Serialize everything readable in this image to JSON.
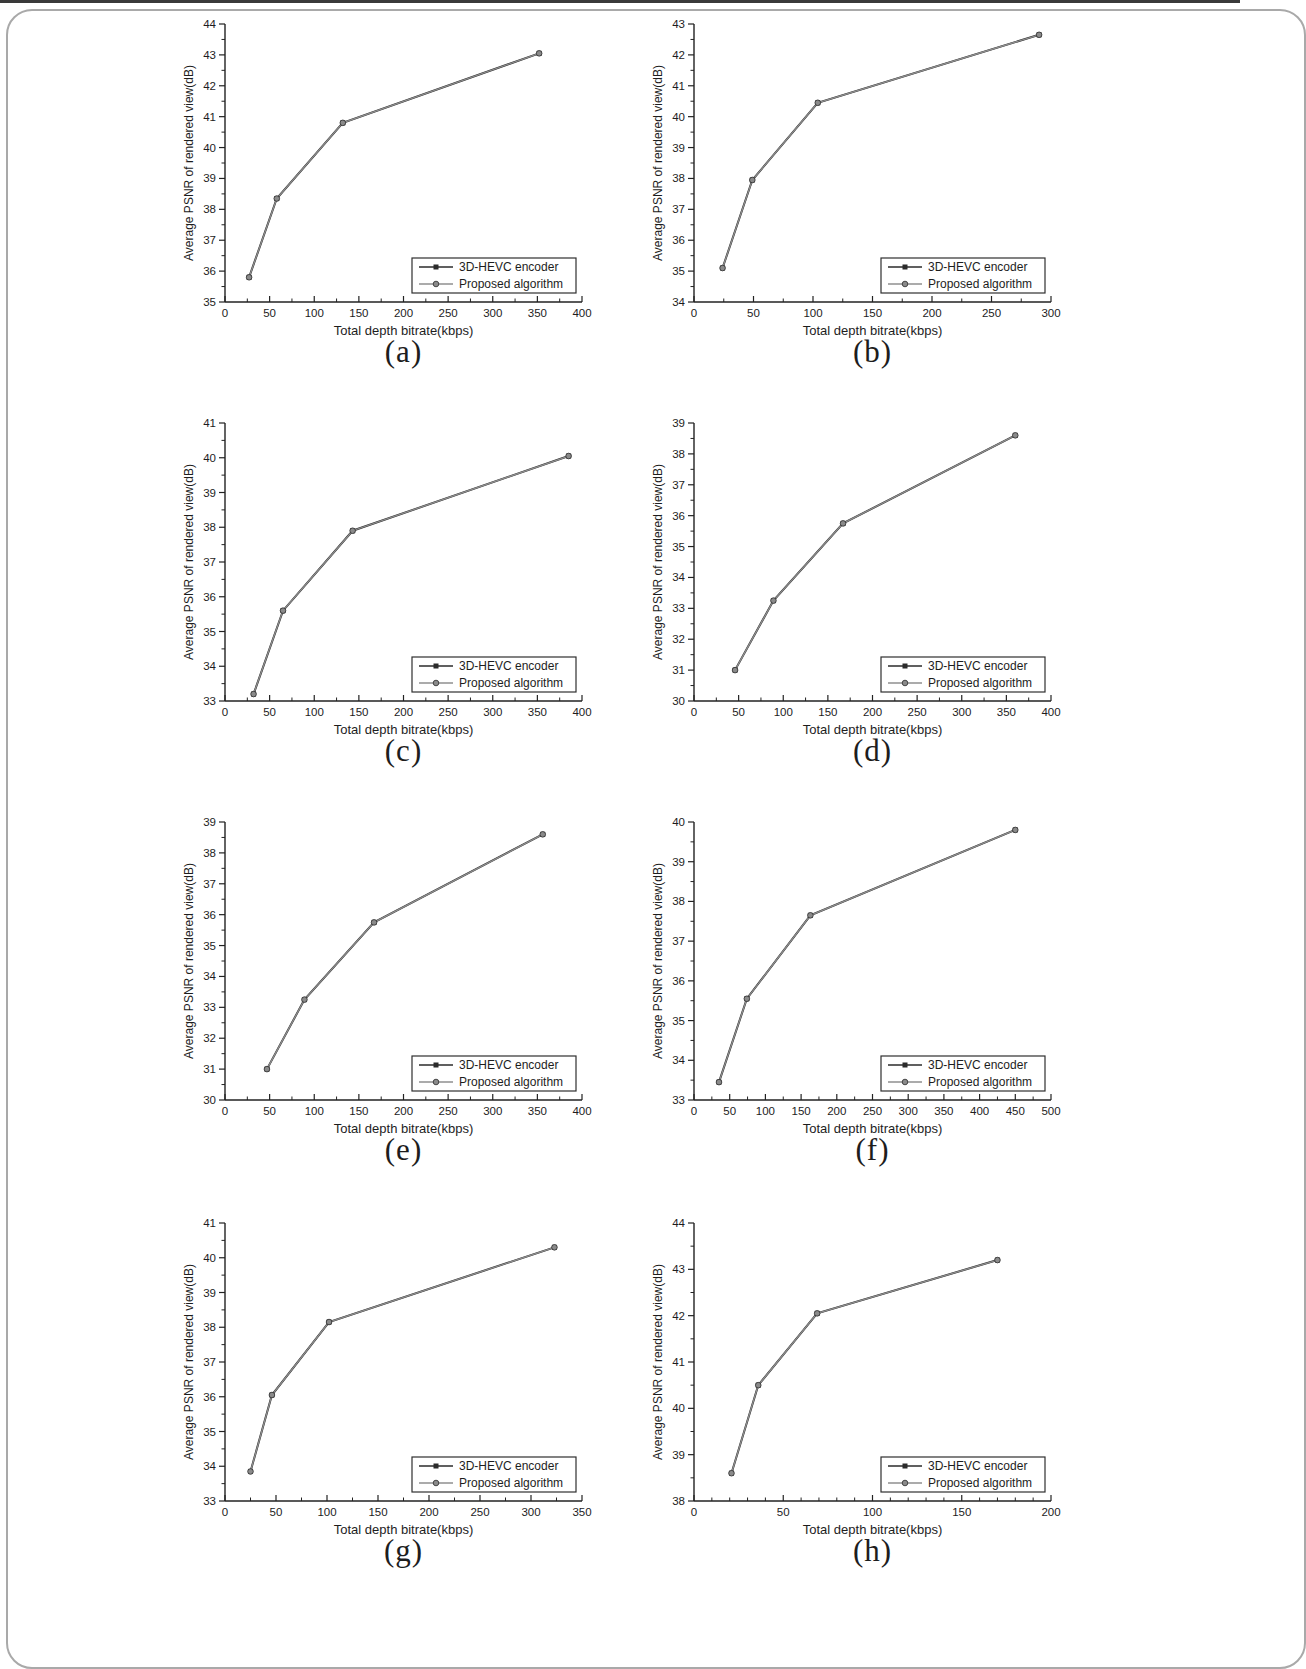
{
  "figure": {
    "xlabel": "Total depth bitrate(kbps)",
    "ylabel": "Average PSNR of rendered view(dB)",
    "series_labels": [
      "3D-HEVC encoder",
      "Proposed algorithm"
    ],
    "legend_position": "bottom-right",
    "grid": "off",
    "colors": {
      "encoder_line": "#2b2b2b",
      "proposed_line": "#8f8f8f",
      "marker_fill": "#8a8a8a",
      "marker_edge": "#3a3a3a",
      "axis": "#222222",
      "text": "#1d1d1d"
    }
  },
  "chart_data": [
    {
      "type": "line",
      "label": "(a)",
      "xlabel": "Total depth bitrate(kbps)",
      "ylabel": "Average PSNR of rendered view(dB)",
      "xlim": [
        0,
        400
      ],
      "xticks": [
        0,
        50,
        100,
        150,
        200,
        250,
        300,
        350,
        400
      ],
      "x_minor_per_major": 1,
      "ylim": [
        35,
        44
      ],
      "yticks": [
        35,
        36,
        37,
        38,
        39,
        40,
        41,
        42,
        43,
        44
      ],
      "y_minor_per_major": 1,
      "series": [
        {
          "name": "3D-HEVC encoder",
          "x": [
            27,
            58,
            132,
            352
          ],
          "y": [
            35.8,
            38.35,
            40.8,
            43.05
          ]
        },
        {
          "name": "Proposed algorithm",
          "x": [
            27,
            58,
            132,
            352
          ],
          "y": [
            35.8,
            38.35,
            40.8,
            43.05
          ]
        }
      ]
    },
    {
      "type": "line",
      "label": "(b)",
      "xlabel": "Total depth bitrate(kbps)",
      "ylabel": "Average PSNR of rendered view(dB)",
      "xlim": [
        0,
        300
      ],
      "xticks": [
        0,
        50,
        100,
        150,
        200,
        250,
        300
      ],
      "x_minor_per_major": 1,
      "ylim": [
        34,
        43
      ],
      "yticks": [
        34,
        35,
        36,
        37,
        38,
        39,
        40,
        41,
        42,
        43
      ],
      "y_minor_per_major": 1,
      "series": [
        {
          "name": "3D-HEVC encoder",
          "x": [
            24,
            49,
            104,
            290
          ],
          "y": [
            35.1,
            37.95,
            40.45,
            42.65
          ]
        },
        {
          "name": "Proposed algorithm",
          "x": [
            24,
            49,
            104,
            290
          ],
          "y": [
            35.1,
            37.95,
            40.45,
            42.65
          ]
        }
      ]
    },
    {
      "type": "line",
      "label": "(c)",
      "xlabel": "Total depth bitrate(kbps)",
      "ylabel": "Average PSNR of rendered view(dB)",
      "xlim": [
        0,
        400
      ],
      "xticks": [
        0,
        50,
        100,
        150,
        200,
        250,
        300,
        350,
        400
      ],
      "x_minor_per_major": 1,
      "ylim": [
        33,
        41
      ],
      "yticks": [
        33,
        34,
        35,
        36,
        37,
        38,
        39,
        40,
        41
      ],
      "y_minor_per_major": 1,
      "series": [
        {
          "name": "3D-HEVC encoder",
          "x": [
            32,
            65,
            143,
            385
          ],
          "y": [
            33.2,
            35.6,
            37.9,
            40.05
          ]
        },
        {
          "name": "Proposed algorithm",
          "x": [
            32,
            65,
            143,
            385
          ],
          "y": [
            33.2,
            35.6,
            37.9,
            40.05
          ]
        }
      ]
    },
    {
      "type": "line",
      "label": "(d)",
      "xlabel": "Total depth bitrate(kbps)",
      "ylabel": "Average PSNR of rendered view(dB)",
      "xlim": [
        0,
        400
      ],
      "xticks": [
        0,
        50,
        100,
        150,
        200,
        250,
        300,
        350,
        400
      ],
      "x_minor_per_major": 1,
      "ylim": [
        30,
        39
      ],
      "yticks": [
        30,
        31,
        32,
        33,
        34,
        35,
        36,
        37,
        38,
        39
      ],
      "y_minor_per_major": 1,
      "series": [
        {
          "name": "3D-HEVC encoder",
          "x": [
            46,
            89,
            167,
            360
          ],
          "y": [
            31.0,
            33.25,
            35.75,
            38.6
          ]
        },
        {
          "name": "Proposed algorithm",
          "x": [
            46,
            89,
            167,
            360
          ],
          "y": [
            31.0,
            33.25,
            35.75,
            38.6
          ]
        }
      ]
    },
    {
      "type": "line",
      "label": "(e)",
      "xlabel": "Total depth bitrate(kbps)",
      "ylabel": "Average PSNR of rendered view(dB)",
      "xlim": [
        0,
        400
      ],
      "xticks": [
        0,
        50,
        100,
        150,
        200,
        250,
        300,
        350,
        400
      ],
      "x_minor_per_major": 1,
      "ylim": [
        30,
        39
      ],
      "yticks": [
        30,
        31,
        32,
        33,
        34,
        35,
        36,
        37,
        38,
        39
      ],
      "y_minor_per_major": 1,
      "series": [
        {
          "name": "3D-HEVC encoder",
          "x": [
            47,
            89,
            167,
            356
          ],
          "y": [
            31.0,
            33.25,
            35.75,
            38.6
          ]
        },
        {
          "name": "Proposed algorithm",
          "x": [
            47,
            89,
            167,
            356
          ],
          "y": [
            31.0,
            33.25,
            35.75,
            38.6
          ]
        }
      ]
    },
    {
      "type": "line",
      "label": "(f)",
      "xlabel": "Total depth bitrate(kbps)",
      "ylabel": "Average PSNR of rendered view(dB)",
      "xlim": [
        0,
        500
      ],
      "xticks": [
        0,
        50,
        100,
        150,
        200,
        250,
        300,
        350,
        400,
        450,
        500
      ],
      "x_minor_per_major": 1,
      "ylim": [
        33,
        40
      ],
      "yticks": [
        33,
        34,
        35,
        36,
        37,
        38,
        39,
        40
      ],
      "y_minor_per_major": 1,
      "series": [
        {
          "name": "3D-HEVC encoder",
          "x": [
            35,
            74,
            163,
            450
          ],
          "y": [
            33.45,
            35.55,
            37.65,
            39.8
          ]
        },
        {
          "name": "Proposed algorithm",
          "x": [
            35,
            74,
            163,
            450
          ],
          "y": [
            33.45,
            35.55,
            37.65,
            39.8
          ]
        }
      ]
    },
    {
      "type": "line",
      "label": "(g)",
      "xlabel": "Total depth bitrate(kbps)",
      "ylabel": "Average PSNR of rendered view(dB)",
      "xlim": [
        0,
        350
      ],
      "xticks": [
        0,
        50,
        100,
        150,
        200,
        250,
        300,
        350
      ],
      "x_minor_per_major": 1,
      "ylim": [
        33,
        41
      ],
      "yticks": [
        33,
        34,
        35,
        36,
        37,
        38,
        39,
        40,
        41
      ],
      "y_minor_per_major": 1,
      "series": [
        {
          "name": "3D-HEVC encoder",
          "x": [
            25,
            46,
            102,
            323
          ],
          "y": [
            33.85,
            36.05,
            38.15,
            40.3
          ]
        },
        {
          "name": "Proposed algorithm",
          "x": [
            25,
            46,
            102,
            323
          ],
          "y": [
            33.85,
            36.05,
            38.15,
            40.3
          ]
        }
      ]
    },
    {
      "type": "line",
      "label": "(h)",
      "xlabel": "Total depth bitrate(kbps)",
      "ylabel": "Average PSNR of rendered view(dB)",
      "xlim": [
        0,
        200
      ],
      "xticks": [
        0,
        50,
        100,
        150,
        200
      ],
      "x_minor_per_major": 4,
      "ylim": [
        38,
        44
      ],
      "yticks": [
        38,
        39,
        40,
        41,
        42,
        43,
        44
      ],
      "y_minor_per_major": 1,
      "series": [
        {
          "name": "3D-HEVC encoder",
          "x": [
            21,
            36,
            69,
            170
          ],
          "y": [
            38.6,
            40.5,
            42.05,
            43.2
          ]
        },
        {
          "name": "Proposed algorithm",
          "x": [
            21,
            36,
            69,
            170
          ],
          "y": [
            38.6,
            40.5,
            42.05,
            43.2
          ]
        }
      ]
    }
  ]
}
